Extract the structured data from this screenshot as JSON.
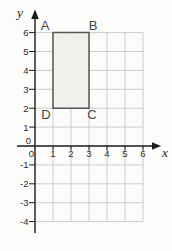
{
  "chart_data": {
    "type": "scatter",
    "title": "",
    "xlabel": "x",
    "ylabel": "y",
    "xlim": [
      -1,
      7
    ],
    "ylim": [
      -5,
      7
    ],
    "x_ticks": [
      0,
      1,
      2,
      3,
      4,
      5,
      6
    ],
    "y_ticks": [
      6,
      5,
      4,
      3,
      2,
      1,
      0,
      -1,
      -2,
      -3,
      -4
    ],
    "grid": true,
    "grid_x_range": [
      0,
      6
    ],
    "grid_y_range": [
      -4,
      6
    ],
    "legend": "none",
    "shapes": [
      {
        "name": "rectangle",
        "label": "ABCD",
        "fill": "#f0efec",
        "stroke": "#565656",
        "vertices": [
          {
            "label": "A",
            "x": 1,
            "y": 6,
            "label_pos": "above-left"
          },
          {
            "label": "B",
            "x": 3,
            "y": 6,
            "label_pos": "above-right"
          },
          {
            "label": "C",
            "x": 3,
            "y": 2,
            "label_pos": "below-right"
          },
          {
            "label": "D",
            "x": 1,
            "y": 2,
            "label_pos": "below-left"
          }
        ]
      }
    ],
    "colors": {
      "grid": "#cdccca",
      "axis": "#1b1b1b",
      "tick_text": "#2b2b2b",
      "vertex_text": "#474747"
    }
  }
}
